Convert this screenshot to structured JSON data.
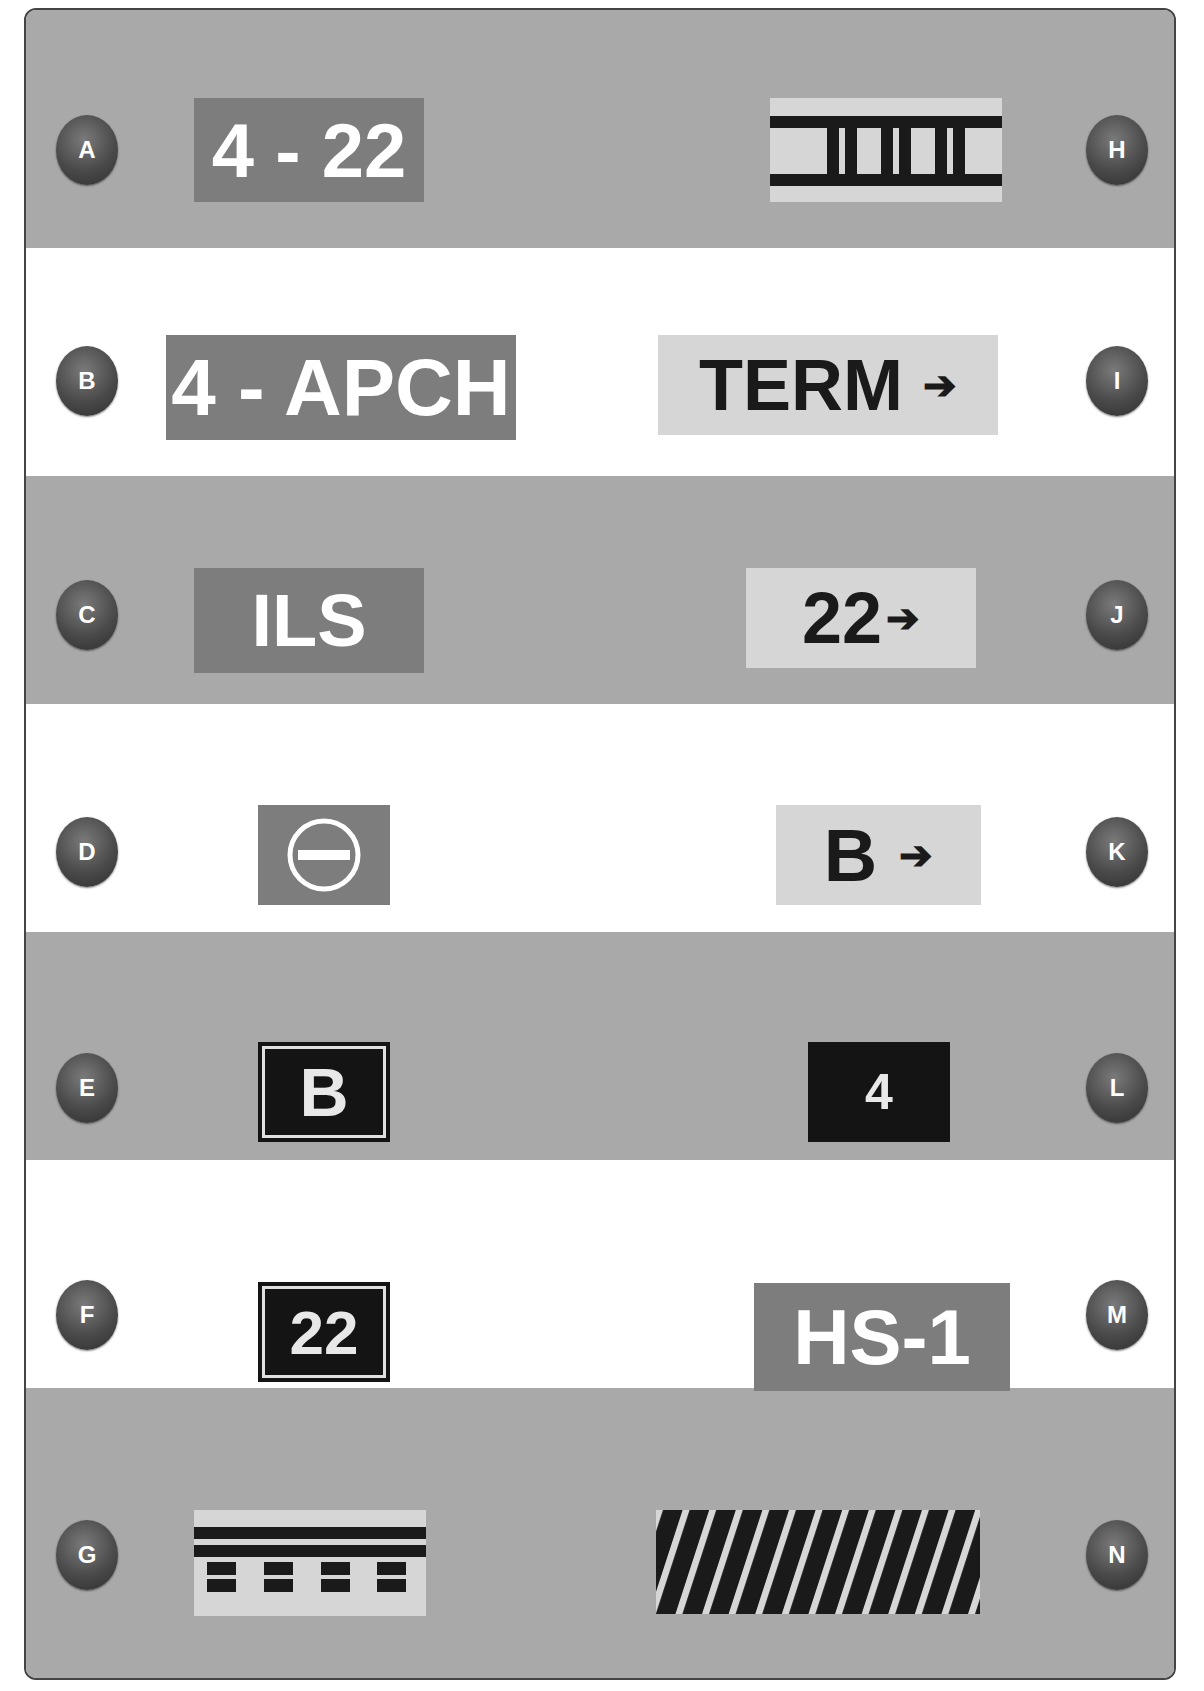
{
  "colors": {
    "band_gray": "#a9a9a9",
    "band_white": "#ffffff",
    "mandatory_sign_bg": "#7d7d7d",
    "direction_sign_bg": "#d6d6d6",
    "location_sign_bg": "#141414",
    "badge_bg": "#4a4a4a"
  },
  "items": {
    "A": {
      "badge": "A",
      "text": "4 - 22",
      "kind": "mandatory-sign"
    },
    "B": {
      "badge": "B",
      "text": "4 - APCH",
      "kind": "mandatory-sign"
    },
    "C": {
      "badge": "C",
      "text": "ILS",
      "kind": "mandatory-sign"
    },
    "D": {
      "badge": "D",
      "text": "",
      "kind": "no-entry-sign",
      "icon": "no-entry-icon"
    },
    "E": {
      "badge": "E",
      "text": "B",
      "kind": "location-sign"
    },
    "F": {
      "badge": "F",
      "text": "22",
      "kind": "location-sign"
    },
    "G": {
      "badge": "G",
      "text": "",
      "kind": "holding-position-marking",
      "icon": "holding-position-marking-icon"
    },
    "H": {
      "badge": "H",
      "text": "",
      "kind": "ils-critical-area-marking",
      "icon": "ils-critical-area-marking-icon"
    },
    "I": {
      "badge": "I",
      "text": "TERM",
      "arrow": "➔",
      "kind": "destination-sign"
    },
    "J": {
      "badge": "J",
      "text": "22",
      "arrow": "➔",
      "kind": "direction-sign"
    },
    "K": {
      "badge": "K",
      "text": "B",
      "arrow": "➔",
      "kind": "direction-sign"
    },
    "L": {
      "badge": "L",
      "text": "4",
      "kind": "distance-remaining-sign"
    },
    "M": {
      "badge": "M",
      "text": "HS-1",
      "kind": "mandatory-sign"
    },
    "N": {
      "badge": "N",
      "text": "",
      "kind": "runway-boundary-marking",
      "icon": "diagonal-stripes-icon"
    }
  }
}
